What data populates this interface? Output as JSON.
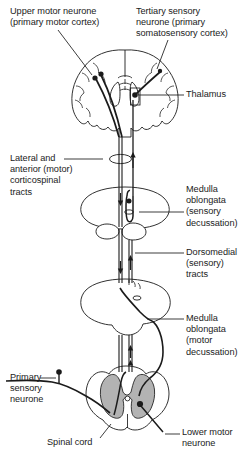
{
  "figure": {
    "background_color": "#ffffff",
    "line_color": "#1b1b1b",
    "gray_matter_color": "#b3b3b3"
  },
  "labels": {
    "upper_motor_neurone": "Upper motor neurone\n(primary motor cortex)",
    "tertiary_sensory_neurone": "Tertiary sensory\nneurone (primary\nsomatosensory cortex)",
    "thalamus": "Thalamus",
    "corticospinal_tracts": "Lateral and\nanterior (motor)\ncorticospinal\ntracts",
    "medulla_sensory": "Medulla\noblongata\n(sensory\ndecussation)",
    "dorsomedial_tracts": "Dorsomedial\n(sensory)\ntracts",
    "medulla_motor": "Medulla\noblongata\n(motor\ndecussation)",
    "primary_sensory_neurone": "Primary\nsensory\nneurone",
    "spinal_cord": "Spinal cord",
    "lower_motor_neurone": "Lower motor\nneurone"
  },
  "structures": [
    {
      "name": "cerebrum",
      "label": "Cerebrum (coronal section)"
    },
    {
      "name": "upper-medulla",
      "label": "Medulla oblongata (sensory decussation)"
    },
    {
      "name": "lower-medulla",
      "label": "Medulla oblongata (motor decussation)"
    },
    {
      "name": "spinal-cord",
      "label": "Spinal cord (cross section)"
    }
  ],
  "pathways": [
    {
      "name": "motor-pathway",
      "label": "Corticospinal motor pathway"
    },
    {
      "name": "sensory-pathway",
      "label": "Dorsal column sensory pathway"
    }
  ]
}
